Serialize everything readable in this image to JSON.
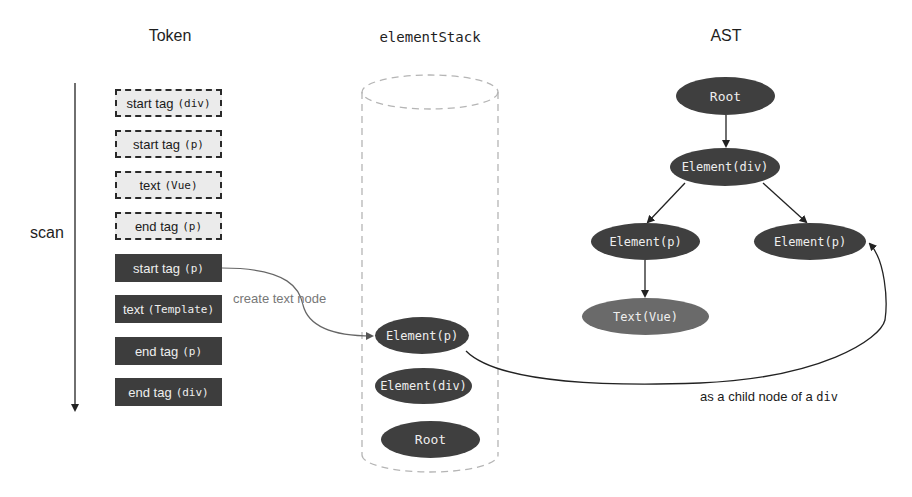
{
  "columns": {
    "token_title": "Token",
    "stack_title": "elementStack",
    "ast_title": "AST"
  },
  "scan": {
    "label": "scan",
    "direction": "down"
  },
  "tokens": [
    {
      "kind": "start tag",
      "arg": "(div)",
      "state": "pending"
    },
    {
      "kind": "start tag",
      "arg": "(p)",
      "state": "pending"
    },
    {
      "kind": "text",
      "arg": "(Vue)",
      "state": "pending"
    },
    {
      "kind": "end tag",
      "arg": "(p)",
      "state": "pending"
    },
    {
      "kind": "start tag",
      "arg": "(p)",
      "state": "consumed"
    },
    {
      "kind": "text",
      "arg": "(Template)",
      "state": "consumed"
    },
    {
      "kind": "end tag",
      "arg": "(p)",
      "state": "consumed"
    },
    {
      "kind": "end tag",
      "arg": "(div)",
      "state": "consumed"
    }
  ],
  "element_stack": [
    {
      "label": "Element(p)",
      "position": "top"
    },
    {
      "label": "Element(div)",
      "position": "middle"
    },
    {
      "label": "Root",
      "position": "bottom"
    }
  ],
  "ast": {
    "nodes": [
      {
        "id": "root",
        "label": "Root"
      },
      {
        "id": "div",
        "label": "Element(div)"
      },
      {
        "id": "p1",
        "label": "Element(p)"
      },
      {
        "id": "p2",
        "label": "Element(p)"
      },
      {
        "id": "text_vue",
        "label": "Text(Vue)"
      }
    ],
    "edges": [
      [
        "root",
        "div"
      ],
      [
        "div",
        "p1"
      ],
      [
        "div",
        "p2"
      ],
      [
        "p1",
        "text_vue"
      ]
    ]
  },
  "annotations": {
    "create_text_node": "create text node",
    "child_node_prefix": "as a child node of a ",
    "child_node_code": "div"
  },
  "colors": {
    "dark_fill": "#3f3f3f",
    "text_node_fill": "#6a6a6a",
    "pending_fill": "#ebebeb",
    "consumed_fill": "#3d3d3d",
    "cylinder_stroke": "#b5b5b5",
    "connector": "#444444"
  }
}
